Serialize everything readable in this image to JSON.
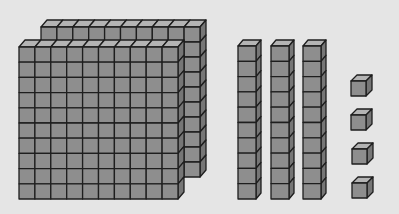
{
  "diagram": {
    "title": "Base-ten blocks",
    "value_represented": 234,
    "colors": {
      "background": "#e5e5e5",
      "front": "#8e8e8e",
      "top": "#b4b4b4",
      "side": "#767676",
      "stroke": "#1e1e1e"
    },
    "groups": [
      {
        "name": "hundreds",
        "label": "Hundreds flats",
        "count": 2
      },
      {
        "name": "tens",
        "label": "Tens rods",
        "count": 3
      },
      {
        "name": "ones",
        "label": "Unit cubes",
        "count": 4
      }
    ],
    "flats": [
      {
        "x": 41,
        "y": 27,
        "cols": 10,
        "rows": 10,
        "cell_w": 15.9,
        "cell_h": 15.0,
        "depth_x": 6,
        "depth_y": 7
      },
      {
        "x": 19,
        "y": 47,
        "cols": 10,
        "rows": 10,
        "cell_w": 15.9,
        "cell_h": 15.2,
        "depth_x": 6,
        "depth_y": 7
      }
    ],
    "rods": [
      {
        "x": 238,
        "y": 46,
        "cols": 1,
        "rows": 10,
        "cell_w": 18,
        "cell_h": 15.3,
        "depth_x": 5,
        "depth_y": 6
      },
      {
        "x": 271,
        "y": 46,
        "cols": 1,
        "rows": 10,
        "cell_w": 18,
        "cell_h": 15.3,
        "depth_x": 5,
        "depth_y": 6
      },
      {
        "x": 303,
        "y": 46,
        "cols": 1,
        "rows": 10,
        "cell_w": 18,
        "cell_h": 15.3,
        "depth_x": 5,
        "depth_y": 6
      }
    ],
    "units": [
      {
        "x": 351,
        "y": 81,
        "cols": 1,
        "rows": 1,
        "cell_w": 15,
        "cell_h": 15,
        "depth_x": 6,
        "depth_y": 6
      },
      {
        "x": 351,
        "y": 115,
        "cols": 1,
        "rows": 1,
        "cell_w": 15,
        "cell_h": 15,
        "depth_x": 6,
        "depth_y": 6
      },
      {
        "x": 352,
        "y": 149,
        "cols": 1,
        "rows": 1,
        "cell_w": 15,
        "cell_h": 15,
        "depth_x": 6,
        "depth_y": 6
      },
      {
        "x": 352,
        "y": 183,
        "cols": 1,
        "rows": 1,
        "cell_w": 15,
        "cell_h": 15,
        "depth_x": 6,
        "depth_y": 6
      }
    ]
  }
}
